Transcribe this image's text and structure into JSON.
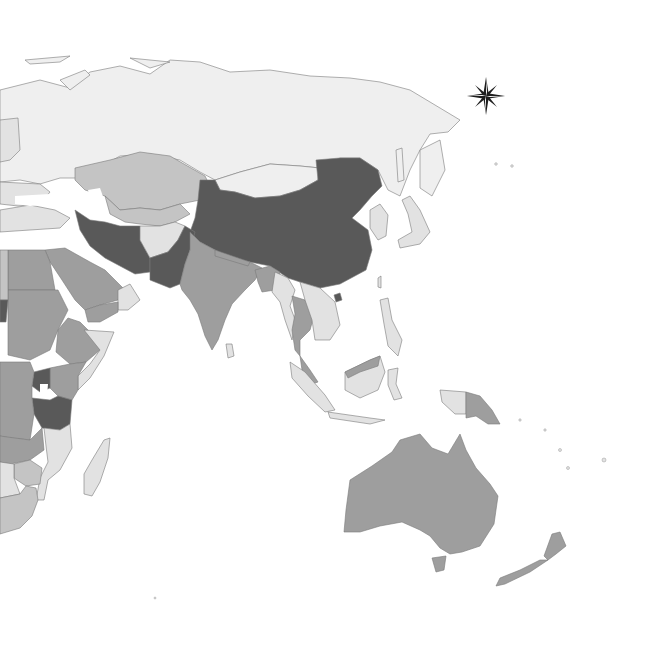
{
  "map": {
    "type": "choropleth",
    "region": "Asia-Pacific / Eastern Hemisphere",
    "background": "#ffffff",
    "shades": {
      "darkest": "#595959",
      "mid": "#9e9e9e",
      "light_mid": "#c4c4c4",
      "light": "#e2e2e2",
      "lightest": "#efefef",
      "border": "#7a7a7a"
    },
    "compass_rose": {
      "icon": "compass-rose-icon",
      "position": "top-right"
    },
    "regions": [
      {
        "name": "Russia",
        "shade": "lightest"
      },
      {
        "name": "Kazakhstan",
        "shade": "light_mid"
      },
      {
        "name": "Mongolia",
        "shade": "lightest"
      },
      {
        "name": "China",
        "shade": "darkest"
      },
      {
        "name": "Iran",
        "shade": "darkest"
      },
      {
        "name": "Pakistan",
        "shade": "darkest"
      },
      {
        "name": "Afghanistan",
        "shade": "light"
      },
      {
        "name": "India",
        "shade": "mid"
      },
      {
        "name": "Myanmar",
        "shade": "light"
      },
      {
        "name": "Thailand",
        "shade": "mid"
      },
      {
        "name": "Indonesia",
        "shade": "light"
      },
      {
        "name": "Papua New Guinea",
        "shade": "mid"
      },
      {
        "name": "Australia",
        "shade": "mid"
      },
      {
        "name": "New Zealand",
        "shade": "mid"
      },
      {
        "name": "Japan",
        "shade": "light"
      },
      {
        "name": "Saudi Arabia",
        "shade": "mid"
      },
      {
        "name": "Sudan",
        "shade": "mid"
      },
      {
        "name": "Ethiopia",
        "shade": "mid"
      },
      {
        "name": "Somalia",
        "shade": "light"
      },
      {
        "name": "Kenya",
        "shade": "mid"
      },
      {
        "name": "Uganda",
        "shade": "darkest"
      },
      {
        "name": "Tanzania",
        "shade": "darkest"
      },
      {
        "name": "Madagascar",
        "shade": "light"
      },
      {
        "name": "Mozambique",
        "shade": "light"
      },
      {
        "name": "South Africa",
        "shade": "light_mid"
      }
    ]
  }
}
